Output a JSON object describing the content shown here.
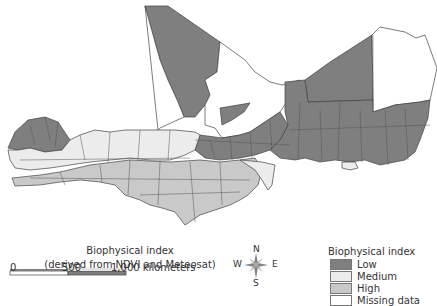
{
  "map": {
    "title_line1": "Biophysical index",
    "title_line2": "(derived from NDVI and Meteosat)",
    "region": "West African Sahel (Senegal to Chad)"
  },
  "scale_bar": {
    "label_0": "0",
    "label_500": "500",
    "label_1000": "1,000 kilometers"
  },
  "compass": {
    "n": "N",
    "s": "S",
    "e": "E",
    "w": "W"
  },
  "legend": {
    "title": "Biophysical index",
    "items": [
      {
        "label": "Low",
        "color": "#7f7f7f"
      },
      {
        "label": "Medium",
        "color": "#ececec"
      },
      {
        "label": "High",
        "color": "#c9c9c9"
      },
      {
        "label": "Missing data",
        "color": "#ffffff"
      }
    ]
  },
  "colors": {
    "low": "#7f7f7f",
    "medium": "#ececec",
    "high": "#c9c9c9",
    "missing": "#ffffff",
    "border": "#444444"
  }
}
